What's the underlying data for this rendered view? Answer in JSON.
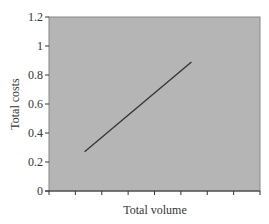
{
  "chart_data": {
    "type": "line",
    "title": "",
    "xlabel": "Total volume",
    "ylabel": "Total costs",
    "ylim": [
      0,
      1.2
    ],
    "yticks": [
      "0",
      "0.2",
      "0.4",
      "0.6",
      "0.8",
      "1",
      "1.2"
    ],
    "xticks_count": 9,
    "xtick_labels": [],
    "grid": false,
    "legend": null,
    "plot_background": "#b5b5b5",
    "series": [
      {
        "name": "Total costs",
        "color": "#333333",
        "x": [
          1.35,
          5.4
        ],
        "y": [
          0.27,
          0.89
        ]
      }
    ]
  }
}
